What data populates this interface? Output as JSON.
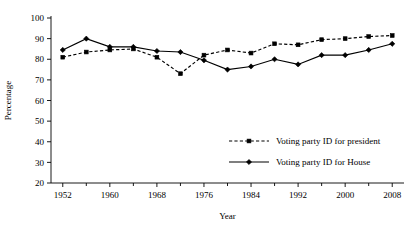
{
  "chart_data": {
    "type": "line",
    "title": "",
    "xlabel": "Year",
    "ylabel": "Percentage",
    "xlim": [
      1950,
      2010
    ],
    "ylim": [
      20,
      100
    ],
    "grid": false,
    "legend_position": "inside-lower-right",
    "x_tick_labels": [
      "1952",
      "1960",
      "1968",
      "1976",
      "1984",
      "1992",
      "2000",
      "2008"
    ],
    "x_tick_values": [
      1952,
      1960,
      1968,
      1976,
      1984,
      1992,
      2000,
      2008
    ],
    "x_minor_tick_values": [
      1956,
      1964,
      1972,
      1980,
      1988,
      1996,
      2004
    ],
    "y_tick_labels": [
      "20",
      "30",
      "40",
      "50",
      "60",
      "70",
      "80",
      "90",
      "100"
    ],
    "y_tick_values": [
      20,
      30,
      40,
      50,
      60,
      70,
      80,
      90,
      100
    ],
    "x": [
      1952,
      1956,
      1960,
      1964,
      1968,
      1972,
      1976,
      1980,
      1984,
      1988,
      1992,
      1996,
      2000,
      2004,
      2008
    ],
    "series": [
      {
        "name": "Voting party ID for president",
        "style": "dashed",
        "marker": "square",
        "values": [
          81,
          83.5,
          84.5,
          85,
          81,
          73,
          82,
          84.5,
          83,
          87.5,
          87,
          89.5,
          90,
          91,
          91.5
        ]
      },
      {
        "name": "Voting party ID for House",
        "style": "solid",
        "marker": "diamond",
        "values": [
          84.5,
          90,
          86,
          86,
          84,
          83.5,
          79.5,
          75,
          76.5,
          80,
          77.5,
          82,
          82,
          84.5,
          87.5
        ]
      }
    ],
    "colors": {
      "axis": "#000000",
      "series_president": "#000000",
      "series_house": "#000000",
      "background": "#ffffff"
    }
  },
  "legend": {
    "entries": [
      {
        "label": "Voting party ID for president"
      },
      {
        "label": "Voting party ID for House"
      }
    ]
  }
}
